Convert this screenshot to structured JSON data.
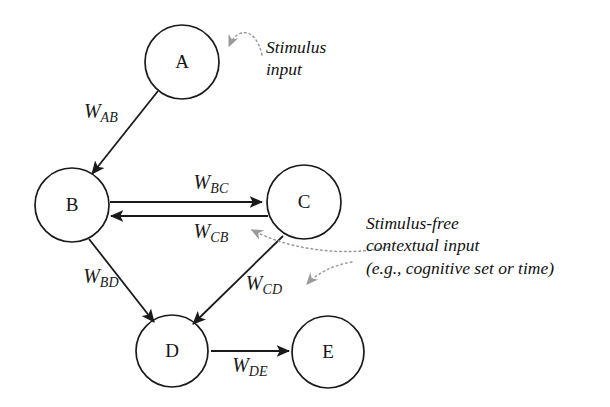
{
  "figure": {
    "background_color": "#ffffff",
    "stroke_color": "#1a1a1a",
    "dotted_stroke_color": "#8a8a8a"
  },
  "nodes": [
    {
      "id": "A",
      "label": "A",
      "cx": 182,
      "cy": 62,
      "r": 37
    },
    {
      "id": "B",
      "label": "B",
      "cx": 72,
      "cy": 205,
      "r": 37
    },
    {
      "id": "C",
      "label": "C",
      "cx": 304,
      "cy": 202,
      "r": 37
    },
    {
      "id": "D",
      "label": "D",
      "cx": 172,
      "cy": 351,
      "r": 36
    },
    {
      "id": "E",
      "label": "E",
      "cx": 328,
      "cy": 352,
      "r": 36
    }
  ],
  "edges": [
    {
      "id": "AB",
      "from": "A",
      "to": "B",
      "weight": "W",
      "subscript": "AB",
      "label_x": 101,
      "label_y": 113
    },
    {
      "id": "BC",
      "from": "B",
      "to": "C",
      "weight": "W",
      "subscript": "BC",
      "label_x": 211,
      "label_y": 184
    },
    {
      "id": "CB",
      "from": "C",
      "to": "B",
      "weight": "W",
      "subscript": "CB",
      "label_x": 211,
      "label_y": 233
    },
    {
      "id": "BD",
      "from": "B",
      "to": "D",
      "weight": "W",
      "subscript": "BD",
      "label_x": 101,
      "label_y": 278
    },
    {
      "id": "CD",
      "from": "C",
      "to": "D",
      "weight": "W",
      "subscript": "CD",
      "label_x": 264,
      "label_y": 285
    },
    {
      "id": "DE",
      "from": "D",
      "to": "E",
      "weight": "W",
      "subscript": "DE",
      "label_x": 250,
      "label_y": 367
    }
  ],
  "annotations": [
    {
      "id": "stimulus-input",
      "lines": [
        "Stimulus",
        "input"
      ],
      "x": 266,
      "y": 36
    },
    {
      "id": "contextual-input",
      "lines": [
        "Stimulus-free",
        "contextual input",
        "(e.g., cognitive set or time)"
      ],
      "x": 366,
      "y": 212
    }
  ]
}
